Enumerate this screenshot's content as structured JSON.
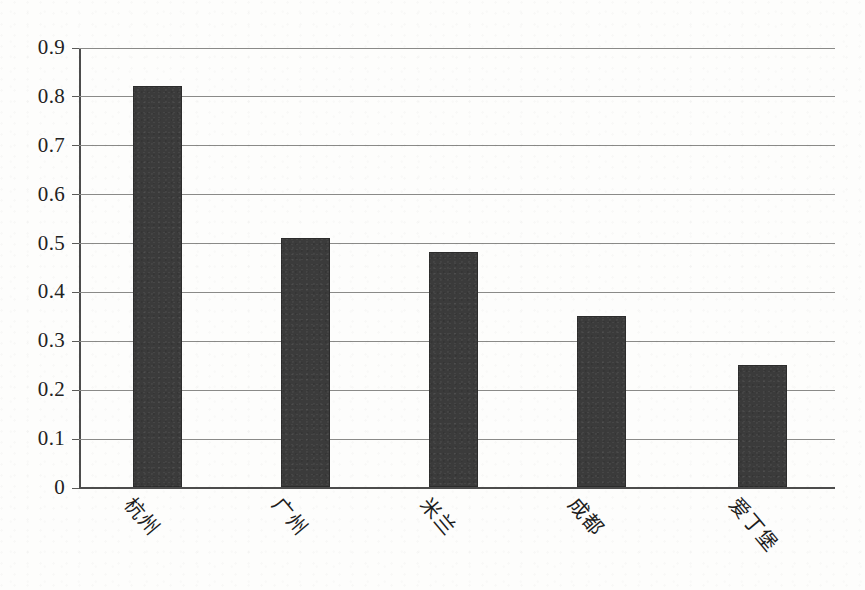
{
  "chart_data": {
    "type": "bar",
    "title": "",
    "subtitle": "",
    "xlabel": "",
    "ylabel": "",
    "categories": [
      "杭州",
      "广州",
      "米兰",
      "成都",
      "爱丁堡"
    ],
    "values": [
      0.82,
      0.51,
      0.48,
      0.35,
      0.25
    ],
    "ylim": [
      0,
      0.9
    ],
    "ytick_labels": [
      "0",
      "0.1",
      "0.2",
      "0.3",
      "0.4",
      "0.5",
      "0.6",
      "0.7",
      "0.8",
      "0.9"
    ],
    "ytick_values": [
      0,
      0.1,
      0.2,
      0.3,
      0.4,
      0.5,
      0.6,
      0.7,
      0.8,
      0.9
    ],
    "grid": true,
    "legend": false,
    "legend_position": "none",
    "bar_color": "#3b3b3b",
    "axis_color": "#4c4c4c",
    "grid_color": "#8a8a88",
    "background_color": "#fdfdfc",
    "xtick_label_rotation_deg": 50
  }
}
